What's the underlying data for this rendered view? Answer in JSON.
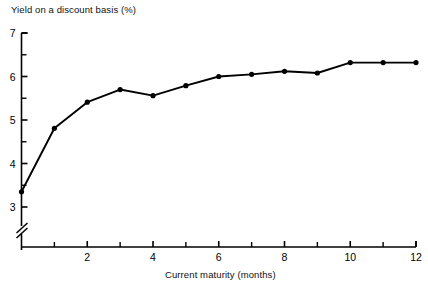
{
  "chart_data": {
    "type": "line",
    "title": "",
    "ylabel": "Yield on a discount basis (%)",
    "xlabel": "Current maturity (months)",
    "x": [
      0,
      1,
      2,
      3,
      4,
      5,
      6,
      7,
      8,
      9,
      10,
      11,
      12
    ],
    "values": [
      3.35,
      4.81,
      5.41,
      5.7,
      5.56,
      5.79,
      6.0,
      6.05,
      6.12,
      6.08,
      6.32,
      6.32,
      6.32
    ],
    "series": [
      {
        "name": "Yield on a discount basis",
        "values": [
          3.35,
          4.81,
          5.41,
          5.7,
          5.56,
          5.79,
          6.0,
          6.05,
          6.12,
          6.08,
          6.32,
          6.32,
          6.32
        ]
      }
    ],
    "xlim": [
      0,
      12
    ],
    "ylim": [
      3,
      7
    ],
    "y_axis_break": true,
    "y_axis_break_note": "axis broken below 3",
    "x_tick_labels": [
      "2",
      "4",
      "6",
      "8",
      "10",
      "12"
    ],
    "x_tick_values": [
      2,
      4,
      6,
      8,
      10,
      12
    ],
    "x_minor_tick_values": [
      1,
      3,
      5,
      7,
      9,
      11
    ],
    "y_tick_labels": [
      "3",
      "4",
      "5",
      "6",
      "7"
    ],
    "y_tick_values": [
      3,
      4,
      5,
      6,
      7
    ],
    "y_minor_tick_values": [
      3.5,
      4.5,
      5.5,
      6.5
    ],
    "grid": false,
    "legend": false,
    "line_color": "#000000",
    "marker": "circle",
    "marker_color": "#000000"
  },
  "axes": {
    "y_title": "Yield on a discount basis (%)",
    "x_title": "Current maturity (months)"
  }
}
